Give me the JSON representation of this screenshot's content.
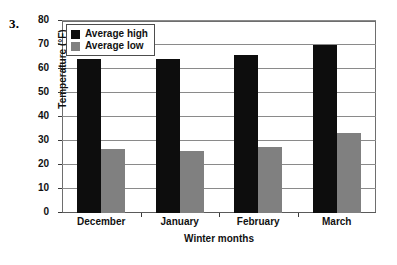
{
  "problem": {
    "number": "3."
  },
  "chart_data": {
    "type": "bar",
    "title": "",
    "xlabel": "Winter months",
    "ylabel": "Temperature (°F)",
    "categories": [
      "December",
      "January",
      "February",
      "March"
    ],
    "series": [
      {
        "name": "Average high",
        "color": "#0d0d0d",
        "values": [
          64,
          64,
          66,
          70
        ]
      },
      {
        "name": "Average low",
        "color": "#808080",
        "values": [
          26.5,
          26,
          27.5,
          33.5
        ]
      }
    ],
    "ylim": [
      0,
      80
    ],
    "yticks": [
      80,
      70,
      60,
      50,
      40,
      30,
      20,
      10,
      0
    ],
    "ytick_labels": [
      "80",
      "70",
      "60",
      "50",
      "40",
      "30",
      "20",
      "10",
      "0"
    ],
    "grid": true,
    "legend_position": "top-left-inside"
  }
}
